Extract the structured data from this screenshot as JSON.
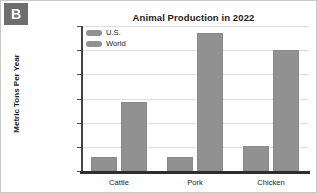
{
  "badge": {
    "label": "B"
  },
  "chart_data": {
    "type": "bar",
    "title": "Animal Production in 2022",
    "xlabel": "",
    "ylabel": "Metric Tons Per Year",
    "categories": [
      "Cattle",
      "Pork",
      "Chicken"
    ],
    "series": [
      {
        "name": "U.S.",
        "values": [
          12000000,
          12000000,
          21000000
        ],
        "color": "#919191"
      },
      {
        "name": "World",
        "values": [
          57000000,
          114000000,
          100000000
        ],
        "color": "#919191"
      }
    ],
    "ylim": [
      0,
      120000000
    ],
    "ytick_values": [
      0,
      20000000,
      40000000,
      60000000,
      80000000,
      100000000,
      120000000
    ],
    "ytick_labels": [
      "0",
      "20,000,000",
      "40,000,000",
      "60,000,000",
      "80,000,000",
      "100,000,000",
      "120,000,000"
    ],
    "grid": true,
    "legend_position": "upper-left-inside",
    "legend_entries": [
      "U.S.",
      "World"
    ]
  }
}
